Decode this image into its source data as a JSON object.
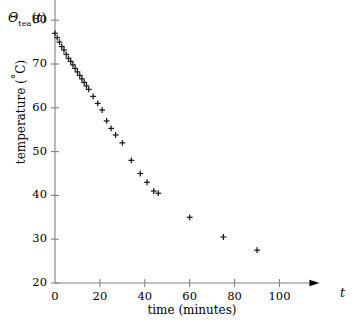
{
  "chart_data": {
    "type": "scatter",
    "title": "",
    "xlabel": "time (minutes)",
    "ylabel": "temperature (°C)",
    "x_variable": "t",
    "y_variable": "Θ_tea(t)",
    "y_variable_base": "Θ",
    "y_variable_subscript": "tea",
    "y_variable_arg": "(t)",
    "xlim": [
      0,
      112
    ],
    "ylim": [
      20,
      84
    ],
    "xticks": [
      0,
      20,
      40,
      60,
      80,
      100
    ],
    "yticks": [
      20,
      30,
      40,
      50,
      60,
      70,
      80
    ],
    "xtick_labels": [
      "0",
      "20",
      "40",
      "60",
      "80",
      "100"
    ],
    "ytick_labels": [
      "20",
      "30",
      "40",
      "50",
      "60",
      "70",
      "80"
    ],
    "grid": false,
    "legend": false,
    "marker": "plus",
    "marker_color": "#1a1a1a",
    "axis_color": "#808080",
    "axis_style": "arrow-terminated",
    "series": [
      {
        "name": "tea temperature",
        "points": [
          [
            0.0,
            77.0
          ],
          [
            1.0,
            76.0
          ],
          [
            2.0,
            75.0
          ],
          [
            3.0,
            74.0
          ],
          [
            4.0,
            73.2
          ],
          [
            5.0,
            72.2
          ],
          [
            6.0,
            71.3
          ],
          [
            7.0,
            70.6
          ],
          [
            8.0,
            69.8
          ],
          [
            9.0,
            69.0
          ],
          [
            10.0,
            68.2
          ],
          [
            11.0,
            67.4
          ],
          [
            12.0,
            66.6
          ],
          [
            13.0,
            65.8
          ],
          [
            14.0,
            65.0
          ],
          [
            15.0,
            64.2
          ],
          [
            17.0,
            62.6
          ],
          [
            19.0,
            61.0
          ],
          [
            21.0,
            59.5
          ],
          [
            23.0,
            57.0
          ],
          [
            25.0,
            55.3
          ],
          [
            27.0,
            53.8
          ],
          [
            30.0,
            52.0
          ],
          [
            34.0,
            48.0
          ],
          [
            38.0,
            45.0
          ],
          [
            41.0,
            43.0
          ],
          [
            44.0,
            41.0
          ],
          [
            46.0,
            40.5
          ],
          [
            60.0,
            35.0
          ],
          [
            75.0,
            30.5
          ],
          [
            90.0,
            27.5
          ]
        ]
      }
    ]
  }
}
